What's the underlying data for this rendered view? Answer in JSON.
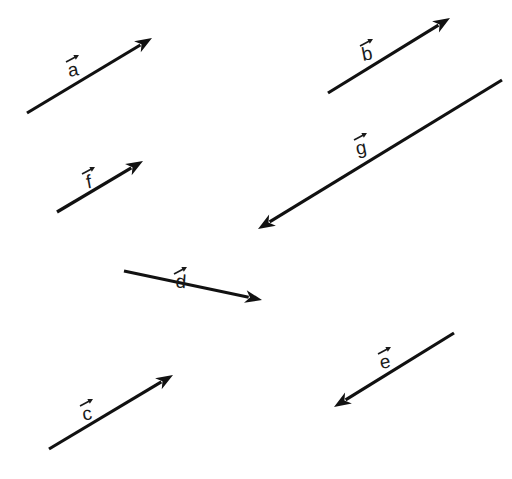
{
  "diagram": {
    "title": "",
    "stroke_color": "#111111",
    "background": "#ffffff",
    "vectors": [
      {
        "name": "a",
        "label": "a",
        "tail": [
          27,
          113
        ],
        "head": [
          152,
          38
        ],
        "label_pos": [
          73,
          60
        ],
        "direction": "up-right"
      },
      {
        "name": "b",
        "label": "b",
        "tail": [
          328,
          93
        ],
        "head": [
          450,
          18
        ],
        "label_pos": [
          367,
          44
        ],
        "direction": "up-right"
      },
      {
        "name": "g",
        "label": "g",
        "tail": [
          502,
          80
        ],
        "head": [
          258,
          229
        ],
        "label_pos": [
          361,
          138
        ],
        "direction": "down-left"
      },
      {
        "name": "f",
        "label": "f",
        "tail": [
          57,
          212
        ],
        "head": [
          143,
          161
        ],
        "label_pos": [
          89,
          172
        ],
        "direction": "up-right"
      },
      {
        "name": "d",
        "label": "d",
        "tail": [
          124,
          271
        ],
        "head": [
          262,
          300
        ],
        "label_pos": [
          181,
          272
        ],
        "direction": "right-slightly-down"
      },
      {
        "name": "e",
        "label": "e",
        "tail": [
          454,
          333
        ],
        "head": [
          334,
          407
        ],
        "label_pos": [
          385,
          352
        ],
        "direction": "down-left"
      },
      {
        "name": "c",
        "label": "c",
        "tail": [
          49,
          449
        ],
        "head": [
          173,
          375
        ],
        "label_pos": [
          87,
          404
        ],
        "direction": "up-right"
      }
    ]
  }
}
